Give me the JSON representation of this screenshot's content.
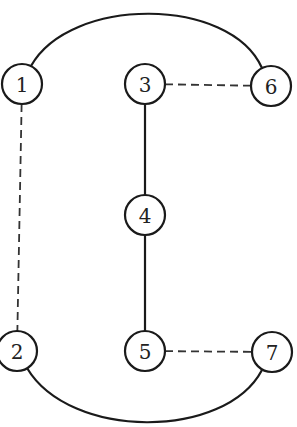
{
  "diagram": {
    "type": "graph",
    "nodes": [
      {
        "id": "1",
        "label": "1"
      },
      {
        "id": "2",
        "label": "2"
      },
      {
        "id": "3",
        "label": "3"
      },
      {
        "id": "4",
        "label": "4"
      },
      {
        "id": "5",
        "label": "5"
      },
      {
        "id": "6",
        "label": "6"
      },
      {
        "id": "7",
        "label": "7"
      }
    ],
    "edges": [
      {
        "from": "1",
        "to": "6",
        "style": "solid",
        "shape": "arc"
      },
      {
        "from": "1",
        "to": "2",
        "style": "dashed",
        "shape": "line"
      },
      {
        "from": "3",
        "to": "6",
        "style": "dashed",
        "shape": "line"
      },
      {
        "from": "3",
        "to": "4",
        "style": "solid",
        "shape": "line"
      },
      {
        "from": "4",
        "to": "5",
        "style": "solid",
        "shape": "line"
      },
      {
        "from": "5",
        "to": "7",
        "style": "dashed",
        "shape": "line"
      },
      {
        "from": "2",
        "to": "7",
        "style": "solid",
        "shape": "arc"
      }
    ]
  }
}
